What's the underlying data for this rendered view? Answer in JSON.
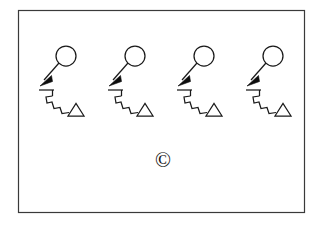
{
  "figure": {
    "background_color": "#ffffff",
    "ink_color": "#1a1a1a",
    "frame_color": "#3a3a3a",
    "frame": {
      "x": 18,
      "y": 10,
      "width": 287,
      "height": 203,
      "stroke_width": 1.2
    },
    "copyright": {
      "symbol": "©",
      "x": 163,
      "y": 161,
      "font_size": 21,
      "color": "#111111"
    },
    "glyph_group": {
      "name": "circle-arrow-zigzag-triangle",
      "count": 4,
      "spacing": 69,
      "origin_x": 38,
      "origin_y": 44,
      "parts": {
        "circle": {
          "cx": 28,
          "cy": 12,
          "r": 10
        },
        "arrow_shaft": {
          "x1": 21,
          "y1": 19,
          "x2": 5,
          "y2": 37
        },
        "arrow_head": "M 2 42 L 13 31 L 15 37 Z",
        "bar": {
          "x1": 1,
          "y1": 46,
          "x2": 15,
          "y2": 46
        },
        "bar_tick": {
          "x1": 14,
          "y1": 46,
          "x2": 14,
          "y2": 52
        },
        "zigzag": "M 14 52 L 8 53 L 9 59 L 14 58 L 16 64 L 22 63 L 24 69 L 31 68",
        "triangle": "M 30 72 L 38 59 L 46 72 Z"
      }
    },
    "glyphs": [
      {
        "id": 1,
        "label": "glyph-group-1",
        "offset_x": 0
      },
      {
        "id": 2,
        "label": "glyph-group-2",
        "offset_x": 69
      },
      {
        "id": 3,
        "label": "glyph-group-3",
        "offset_x": 138
      },
      {
        "id": 4,
        "label": "glyph-group-4",
        "offset_x": 207
      }
    ]
  }
}
